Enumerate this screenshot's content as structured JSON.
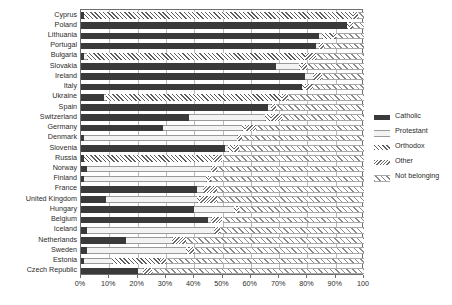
{
  "chart_data": {
    "type": "bar",
    "orientation": "horizontal",
    "stacked": true,
    "title": "",
    "xlabel": "",
    "ylabel": "",
    "xlim": [
      0,
      100
    ],
    "xticks": [
      "0%",
      "10%",
      "20%",
      "30%",
      "40%",
      "50%",
      "60%",
      "70%",
      "80%",
      "90%",
      "100"
    ],
    "grid": true,
    "legend_position": "right",
    "series": [
      {
        "name": "Catholic",
        "key": "catholic",
        "swatch": "solid-dark"
      },
      {
        "name": "Protestant",
        "key": "protestant",
        "swatch": "light-line"
      },
      {
        "name": "Orthodox",
        "key": "orthodox",
        "swatch": "hatch-coarse"
      },
      {
        "name": "Other",
        "key": "other",
        "swatch": "hatch-fine"
      },
      {
        "name": "Not belonging",
        "key": "none",
        "swatch": "hatch-light"
      }
    ],
    "categories": [
      "Cyprus",
      "Poland",
      "Lithuania",
      "Portugal",
      "Bulgaria",
      "Slovakia",
      "Ireland",
      "Italy",
      "Ukraine",
      "Spain",
      "Switzerland",
      "Germany",
      "Denmark",
      "Slovenia",
      "Russia",
      "Norway",
      "Finland",
      "France",
      "United Kingdom",
      "Hungary",
      "Belgium",
      "Iceland",
      "Netherlands",
      "Sweden",
      "Estonia",
      "Czech Republic"
    ],
    "rows": [
      {
        "country": "Cyprus",
        "catholic": 1,
        "protestant": 0,
        "orthodox": 95,
        "other": 2,
        "none": 2
      },
      {
        "country": "Poland",
        "catholic": 94,
        "protestant": 0,
        "orthodox": 1,
        "other": 1,
        "none": 4
      },
      {
        "country": "Lithuania",
        "catholic": 84,
        "protestant": 1,
        "orthodox": 4,
        "other": 1,
        "none": 10
      },
      {
        "country": "Portugal",
        "catholic": 83,
        "protestant": 1,
        "orthodox": 0,
        "other": 2,
        "none": 14
      },
      {
        "country": "Bulgaria",
        "catholic": 1,
        "protestant": 1,
        "orthodox": 77,
        "other": 4,
        "none": 17
      },
      {
        "country": "Slovakia",
        "catholic": 69,
        "protestant": 8,
        "orthodox": 1,
        "other": 2,
        "none": 20
      },
      {
        "country": "Ireland",
        "catholic": 79,
        "protestant": 3,
        "orthodox": 0,
        "other": 3,
        "none": 15
      },
      {
        "country": "Italy",
        "catholic": 78,
        "protestant": 0,
        "orthodox": 1,
        "other": 3,
        "none": 18
      },
      {
        "country": "Ukraine",
        "catholic": 8,
        "protestant": 1,
        "orthodox": 62,
        "other": 2,
        "none": 27
      },
      {
        "country": "Spain",
        "catholic": 66,
        "protestant": 1,
        "orthodox": 0,
        "other": 2,
        "none": 31
      },
      {
        "country": "Switzerland",
        "catholic": 38,
        "protestant": 27,
        "orthodox": 2,
        "other": 4,
        "none": 29
      },
      {
        "country": "Germany",
        "catholic": 29,
        "protestant": 28,
        "orthodox": 1,
        "other": 4,
        "none": 38
      },
      {
        "country": "Denmark",
        "catholic": 1,
        "protestant": 54,
        "orthodox": 0,
        "other": 2,
        "none": 43
      },
      {
        "country": "Slovenia",
        "catholic": 51,
        "protestant": 1,
        "orthodox": 2,
        "other": 2,
        "none": 44
      },
      {
        "country": "Russia",
        "catholic": 1,
        "protestant": 0,
        "orthodox": 46,
        "other": 3,
        "none": 50
      },
      {
        "country": "Norway",
        "catholic": 2,
        "protestant": 44,
        "orthodox": 0,
        "other": 2,
        "none": 52
      },
      {
        "country": "Finland",
        "catholic": 1,
        "protestant": 43,
        "orthodox": 1,
        "other": 1,
        "none": 54
      },
      {
        "country": "France",
        "catholic": 41,
        "protestant": 2,
        "orthodox": 0,
        "other": 5,
        "none": 52
      },
      {
        "country": "United Kingdom",
        "catholic": 9,
        "protestant": 32,
        "orthodox": 1,
        "other": 6,
        "none": 52
      },
      {
        "country": "Hungary",
        "catholic": 40,
        "protestant": 14,
        "orthodox": 1,
        "other": 1,
        "none": 44
      },
      {
        "country": "Belgium",
        "catholic": 45,
        "protestant": 1,
        "orthodox": 0,
        "other": 4,
        "none": 50
      },
      {
        "country": "Iceland",
        "catholic": 2,
        "protestant": 45,
        "orthodox": 0,
        "other": 2,
        "none": 51
      },
      {
        "country": "Netherlands",
        "catholic": 16,
        "protestant": 16,
        "orthodox": 0,
        "other": 5,
        "none": 63
      },
      {
        "country": "Sweden",
        "catholic": 2,
        "protestant": 35,
        "orthodox": 1,
        "other": 2,
        "none": 60
      },
      {
        "country": "Estonia",
        "catholic": 1,
        "protestant": 10,
        "orthodox": 17,
        "other": 2,
        "none": 70
      },
      {
        "country": "Czech Republic",
        "catholic": 20,
        "protestant": 2,
        "orthodox": 0,
        "other": 3,
        "none": 75
      }
    ]
  },
  "legend": {
    "items": [
      {
        "label": "Catholic"
      },
      {
        "label": "Protestant"
      },
      {
        "label": "Orthodox"
      },
      {
        "label": "Other"
      },
      {
        "label": "Not belonging"
      }
    ]
  },
  "colors": {
    "catholic": "#3a3a3a",
    "protestant": "#f3f3f3",
    "orthodox": "#5d5d5d",
    "other": "#6a6a6a",
    "none": "#8a8a8a",
    "axis": "#6e6e6e",
    "grid": "#b9b9b9",
    "text": "#2b2b2b"
  }
}
